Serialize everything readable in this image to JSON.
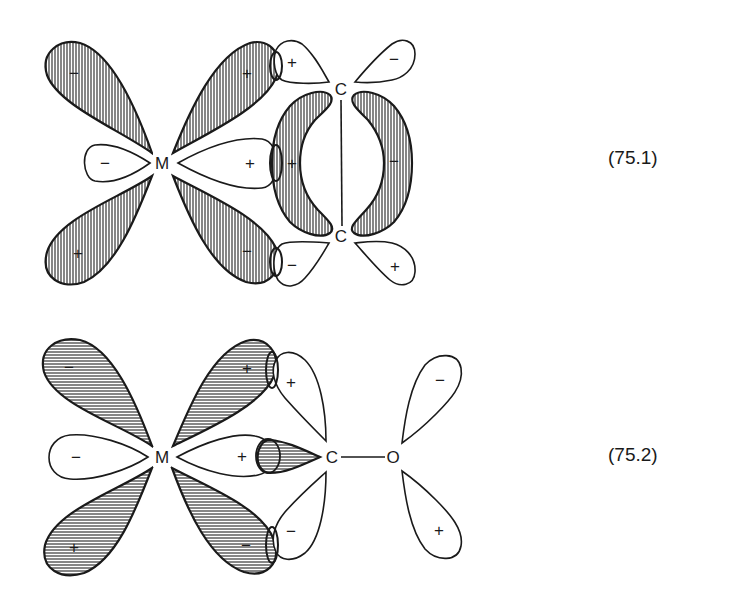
{
  "figure_75_1": {
    "equation_label": "(75.1)",
    "description": "Metal d-orbital interaction with alkene pi system",
    "atoms": {
      "metal": "M",
      "carbon_top": "C",
      "carbon_bottom": "C"
    },
    "metal_lobes": {
      "upper_left": "−",
      "upper_right": "+",
      "lower_left": "+",
      "lower_right": "−",
      "axial_left": "−",
      "axial_right": "+"
    },
    "pi_lobes": {
      "left_banana": "+",
      "right_banana": "−"
    },
    "carbon_p_lobes": {
      "top_left": "+",
      "top_right": "−",
      "bottom_left": "−",
      "bottom_right": "+"
    }
  },
  "figure_75_2": {
    "equation_label": "(75.2)",
    "description": "Metal d-orbital interaction with carbonyl ligand",
    "atoms": {
      "metal": "M",
      "carbon": "C",
      "oxygen": "O"
    },
    "metal_lobes": {
      "upper_left": "−",
      "upper_right": "+",
      "lower_left": "+",
      "lower_right": "−",
      "axial_left": "−",
      "axial_right": "+"
    },
    "carbon_lobes": {
      "upper": "+",
      "lower": "−"
    },
    "oxygen_lobes": {
      "upper": "−",
      "lower": "+"
    }
  },
  "colors": {
    "ink": "#1a1a1a",
    "background": "#ffffff"
  }
}
